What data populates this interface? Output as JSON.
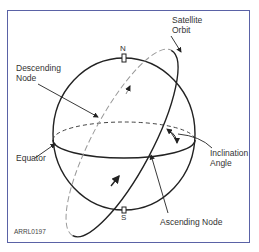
{
  "figure": {
    "id_label": "ARRL0197",
    "labels": {
      "satellite_orbit_line1": "Satellite",
      "satellite_orbit_line2": "Orbit",
      "descending_node_line1": "Descending",
      "descending_node_line2": "Node",
      "equator": "Equator",
      "inclination_angle_line1": "Inclination",
      "inclination_angle_line2": "Angle",
      "ascending_node": "Ascending Node",
      "north": "N",
      "south": "S"
    },
    "colors": {
      "frame": "#5a62a6",
      "lines": "#222222",
      "orbit_back": "#9a9a9a",
      "text": "#333333"
    }
  }
}
